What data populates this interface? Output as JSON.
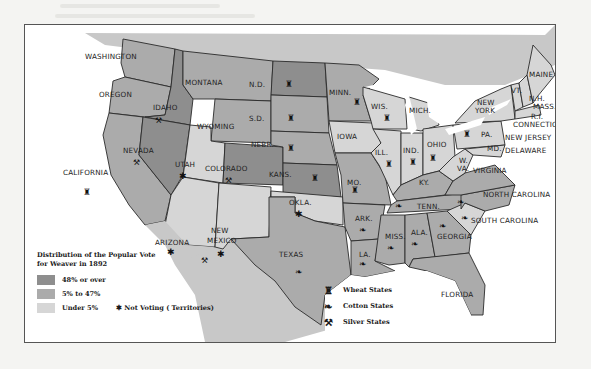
{
  "map": {
    "title_lines": [
      "Distribution  of the Popular Vote",
      "for Weaver in 1892"
    ],
    "colors": {
      "high": "#8e8e8e",
      "mid": "#ababab",
      "low": "#d6d6d6",
      "water": "#ffffff",
      "foreign": "#c8c8c8",
      "border": "#2a2a2a"
    },
    "legend": {
      "categories": [
        {
          "key": "high",
          "label": "48% or over"
        },
        {
          "key": "mid",
          "label": "5% to 47%"
        },
        {
          "key": "low",
          "label": "Under 5%"
        }
      ],
      "not_voting": "✱ Not Voting ( Territories)"
    },
    "symbols": [
      {
        "icon": "wheat-icon",
        "glyph": "♜",
        "label": "Wheat States"
      },
      {
        "icon": "cotton-icon",
        "glyph": "❧",
        "label": "Cotton States"
      },
      {
        "icon": "silver-icon",
        "glyph": "⚒",
        "label": "Silver States"
      }
    ],
    "states": [
      {
        "name": "WASHINGTON",
        "cat": "mid"
      },
      {
        "name": "OREGON",
        "cat": "mid"
      },
      {
        "name": "CALIFORNIA",
        "cat": "mid",
        "symbols": [
          "wheat"
        ]
      },
      {
        "name": "IDAHO",
        "cat": "high",
        "symbols": [
          "silver"
        ]
      },
      {
        "name": "NEVADA",
        "cat": "high",
        "symbols": [
          "silver"
        ]
      },
      {
        "name": "MONTANA",
        "cat": "mid"
      },
      {
        "name": "WYOMING",
        "cat": "mid"
      },
      {
        "name": "UTAH",
        "cat": "low",
        "territory": true
      },
      {
        "name": "COLORADO",
        "cat": "high",
        "symbols": [
          "silver"
        ]
      },
      {
        "name": "ARIZONA",
        "cat": "low",
        "territory": true
      },
      {
        "name": "NEW MEXICO",
        "cat": "low",
        "territory": true,
        "symbols": [
          "silver"
        ]
      },
      {
        "name": "N.D.",
        "cat": "high",
        "symbols": [
          "wheat"
        ]
      },
      {
        "name": "S.D.",
        "cat": "mid",
        "symbols": [
          "wheat"
        ]
      },
      {
        "name": "NEBR.",
        "cat": "mid",
        "symbols": [
          "wheat"
        ]
      },
      {
        "name": "KANS.",
        "cat": "high",
        "symbols": [
          "wheat"
        ]
      },
      {
        "name": "OKLA.",
        "cat": "low",
        "territory": true
      },
      {
        "name": "TEXAS",
        "cat": "mid",
        "symbols": [
          "cotton"
        ]
      },
      {
        "name": "MINN.",
        "cat": "mid",
        "symbols": [
          "wheat"
        ]
      },
      {
        "name": "IOWA",
        "cat": "low"
      },
      {
        "name": "MO.",
        "cat": "mid",
        "symbols": [
          "wheat"
        ]
      },
      {
        "name": "ARK.",
        "cat": "mid",
        "symbols": [
          "cotton"
        ]
      },
      {
        "name": "LA.",
        "cat": "mid",
        "symbols": [
          "cotton"
        ]
      },
      {
        "name": "WIS.",
        "cat": "low",
        "symbols": [
          "wheat"
        ]
      },
      {
        "name": "MICH.",
        "cat": "low"
      },
      {
        "name": "ILL.",
        "cat": "low",
        "symbols": [
          "wheat"
        ]
      },
      {
        "name": "IND.",
        "cat": "low",
        "symbols": [
          "wheat"
        ]
      },
      {
        "name": "OHIO",
        "cat": "low",
        "symbols": [
          "wheat"
        ]
      },
      {
        "name": "KY.",
        "cat": "mid"
      },
      {
        "name": "TENN.",
        "cat": "mid",
        "symbols": [
          "cotton"
        ]
      },
      {
        "name": "MISS.",
        "cat": "mid",
        "symbols": [
          "cotton"
        ]
      },
      {
        "name": "ALA.",
        "cat": "mid",
        "symbols": [
          "cotton"
        ]
      },
      {
        "name": "GEORGIA",
        "cat": "mid",
        "symbols": [
          "cotton"
        ]
      },
      {
        "name": "FLORIDA",
        "cat": "mid"
      },
      {
        "name": "NORTH CAROLINA",
        "cat": "mid",
        "symbols": [
          "cotton"
        ]
      },
      {
        "name": "SOUTH CAROLINA",
        "cat": "low",
        "symbols": [
          "cotton"
        ]
      },
      {
        "name": "VIRGINIA",
        "cat": "mid"
      },
      {
        "name": "W. VA.",
        "cat": "low"
      },
      {
        "name": "PA.",
        "cat": "low",
        "symbols": [
          "wheat"
        ]
      },
      {
        "name": "NEW YORK",
        "cat": "low"
      },
      {
        "name": "MD.",
        "cat": "low"
      },
      {
        "name": "DELAWARE",
        "cat": "low"
      },
      {
        "name": "NEW JERSEY",
        "cat": "low"
      },
      {
        "name": "CONNECTICUT",
        "cat": "low"
      },
      {
        "name": "R.I.",
        "cat": "low"
      },
      {
        "name": "MASS.",
        "cat": "low"
      },
      {
        "name": "N.H.",
        "cat": "low"
      },
      {
        "name": "VT.",
        "cat": "low"
      },
      {
        "name": "MAINE",
        "cat": "low"
      }
    ]
  }
}
